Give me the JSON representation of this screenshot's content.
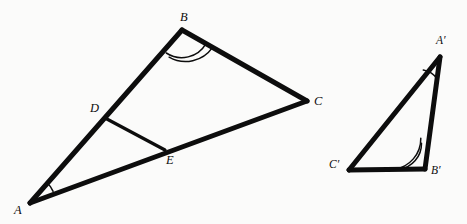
{
  "figure": {
    "background_color": "#fbfbfa",
    "stroke_color": "#0d0d0d",
    "side_stroke_width": 5.0,
    "cevian_stroke_width": 3.2,
    "arc_stroke_width": 1.4,
    "canvas": {
      "width": 467,
      "height": 224
    }
  },
  "triangles": [
    {
      "name": "large-triangle-ABC",
      "vertices": [
        {
          "id": "A",
          "label": "A",
          "x": 30,
          "y": 203,
          "label_x": 14,
          "label_y": 204
        },
        {
          "id": "B",
          "label": "B",
          "x": 182,
          "y": 30,
          "label_x": 180,
          "label_y": 11
        },
        {
          "id": "C",
          "label": "C",
          "x": 307,
          "y": 101,
          "label_x": 314,
          "label_y": 98
        }
      ],
      "sides": [
        {
          "name": "side-AB",
          "from": "A",
          "to": "B"
        },
        {
          "name": "side-BC",
          "from": "B",
          "to": "C"
        },
        {
          "name": "side-AC",
          "from": "A",
          "to": "C"
        }
      ],
      "interior_points": [
        {
          "id": "D",
          "label": "D",
          "x": 105,
          "y": 118,
          "on_side": "AB",
          "label_x": 90,
          "label_y": 105
        },
        {
          "id": "E",
          "label": "E",
          "x": 165,
          "y": 150,
          "on_side": "AC",
          "label_x": 166,
          "label_y": 155
        }
      ],
      "segments": [
        {
          "name": "segment-DE",
          "from": "D",
          "to": "E"
        }
      ],
      "angle_marks": [
        {
          "name": "angle-mark-A",
          "at": "A",
          "arcs": 1,
          "radius": 26
        },
        {
          "name": "angle-mark-B",
          "at": "B",
          "arcs": 2,
          "radius": 28
        }
      ]
    },
    {
      "name": "small-triangle-A-prime-B-prime-C-prime",
      "vertices": [
        {
          "id": "A'",
          "label": "A′",
          "x": 440,
          "y": 57,
          "label_x": 437,
          "label_y": 38
        },
        {
          "id": "B'",
          "label": "B′",
          "x": 425,
          "y": 169,
          "label_x": 431,
          "label_y": 167
        },
        {
          "id": "C'",
          "label": "C′",
          "x": 349,
          "y": 170,
          "label_x": 329,
          "label_y": 161
        }
      ],
      "sides": [
        {
          "name": "side-A-prime-B-prime",
          "from": "A'",
          "to": "B'"
        },
        {
          "name": "side-B-prime-C-prime",
          "from": "B'",
          "to": "C'"
        },
        {
          "name": "side-A-prime-C-prime",
          "from": "A'",
          "to": "C'"
        }
      ],
      "angle_marks": [
        {
          "name": "angle-mark-A-prime",
          "at": "A'",
          "arcs": 1,
          "radius": 22
        },
        {
          "name": "angle-mark-B-prime",
          "at": "B'",
          "arcs": 2,
          "radius": 26
        }
      ]
    }
  ],
  "labels": {
    "A": "A",
    "B": "B",
    "C": "C",
    "D": "D",
    "E": "E",
    "A_prime": "A′",
    "B_prime": "B′",
    "C_prime": "C′"
  }
}
